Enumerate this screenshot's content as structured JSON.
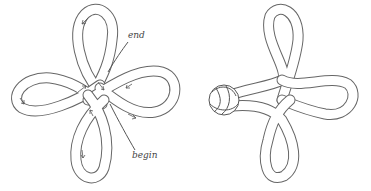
{
  "figure": {
    "left": {
      "description": "four-loop knot with direction arrows",
      "labels": {
        "end": "end",
        "begin": "begin"
      }
    },
    "right": {
      "description": "finished three-loop knot with button knot"
    }
  },
  "colors": {
    "line": "#555555",
    "background": "#ffffff"
  }
}
